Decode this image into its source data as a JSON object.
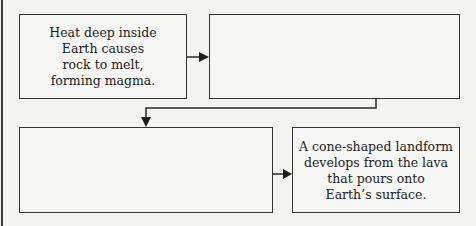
{
  "diagram": {
    "type": "flowchart",
    "boxes": [
      {
        "id": "box1",
        "text": "Heat deep inside\nEarth causes\nrock to melt,\nforming magma.",
        "filled": true
      },
      {
        "id": "box2",
        "text": "",
        "filled": false
      },
      {
        "id": "box3",
        "text": "",
        "filled": false
      },
      {
        "id": "box4",
        "text": "A cone-shaped landform\ndevelops from the lava\nthat pours onto\nEarth’s surface.",
        "filled": true
      }
    ],
    "arrows": [
      {
        "from": "box1",
        "to": "box2",
        "direction": "right"
      },
      {
        "from": "box2",
        "to": "box3",
        "direction": "down-left-down"
      },
      {
        "from": "box3",
        "to": "box4",
        "direction": "right"
      }
    ],
    "colors": {
      "line": "#333333",
      "background": "#f3f3f1",
      "text": "#1c1c1c"
    }
  }
}
